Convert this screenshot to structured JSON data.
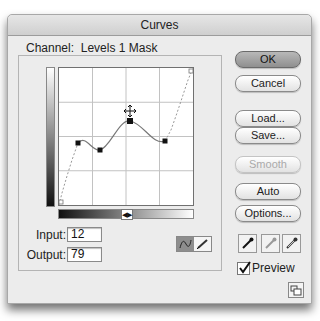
{
  "window": {
    "title": "Curves"
  },
  "channel": {
    "label": "Channel:",
    "value": "Levels 1 Mask"
  },
  "graph": {
    "grid_divisions": 4,
    "curve_points_screen": [
      [
        0,
        137
      ],
      [
        19,
        75
      ],
      [
        41,
        82
      ],
      [
        71,
        53
      ],
      [
        106,
        73
      ],
      [
        134,
        0
      ]
    ],
    "active_point_index": 3,
    "cursor": "move-crosshair",
    "gradient_toggle_glyph": "◀▶"
  },
  "readout": {
    "input_label": "Input:",
    "input_value": "12",
    "output_label": "Output:",
    "output_value": "79"
  },
  "mode_toggle": {
    "selected": "curve",
    "options": [
      "curve",
      "pencil"
    ]
  },
  "buttons": {
    "ok": "OK",
    "cancel": "Cancel",
    "load": "Load...",
    "save": "Save...",
    "smooth": "Smooth",
    "auto": "Auto",
    "options": "Options..."
  },
  "eyedroppers": [
    "black-point",
    "gray-point",
    "white-point"
  ],
  "preview": {
    "label": "Preview",
    "checked": true
  },
  "colors": {
    "default_button": "#9a9a9a",
    "window_bg": "#ececec"
  }
}
